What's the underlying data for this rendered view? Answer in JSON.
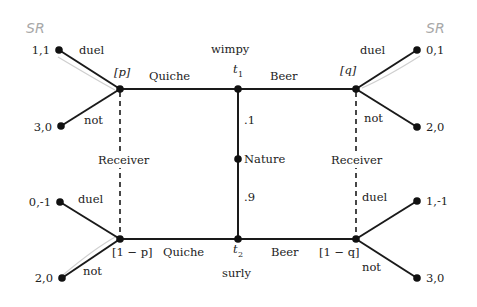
{
  "diagram": {
    "annotations": {
      "top_left": "SR",
      "top_right": "SR"
    },
    "nature": {
      "label": "Nature",
      "prob_top": ".1",
      "prob_bottom": ".9"
    },
    "types": {
      "top": {
        "name": "wimpy",
        "symbol": "t",
        "sub": "1"
      },
      "bottom": {
        "name": "surly",
        "symbol": "t",
        "sub": "2"
      }
    },
    "signals": {
      "top_left": "Quiche",
      "top_right": "Beer",
      "bottom_left": "Quiche",
      "bottom_right": "Beer"
    },
    "beliefs": {
      "top_left": "[p]",
      "top_right": "[q]",
      "bottom_left": "[1 − p]",
      "bottom_right": "[1 − q]"
    },
    "info_sets": {
      "left": "Receiver",
      "right": "Receiver"
    },
    "actions": {
      "tl_up": "duel",
      "tl_down": "not",
      "tr_up": "duel",
      "tr_down": "not",
      "bl_up": "duel",
      "bl_down": "not",
      "br_up": "duel",
      "br_down": "not"
    },
    "payoffs": {
      "tl_up": "1,1",
      "tl_down": "3,0",
      "tr_up": "0,1",
      "tr_down": "2,0",
      "bl_up": "0,-1",
      "bl_down": "2,0",
      "br_up": "1,-1",
      "br_down": "3,0"
    },
    "colors": {
      "lines": "#1a1a1a",
      "highlight": "#cfcfcf",
      "handwriting": "#a8a8a8"
    }
  }
}
